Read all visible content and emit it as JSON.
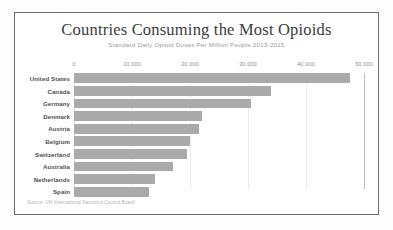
{
  "chart_data": {
    "type": "bar",
    "orientation": "horizontal",
    "title": "Countries Consuming the Most Opioids",
    "subtitle": "Standard Daily Opioid Doses Per Million People 2013-2015",
    "xlabel": "",
    "ylabel": "",
    "xlim": [
      0,
      50000
    ],
    "grid": true,
    "legend": false,
    "source": "Source: UN International Narcotics Control Board",
    "tick_labels": [
      "0",
      "10,000",
      "20,000",
      "30,000",
      "40,000",
      "50,000"
    ],
    "tick_values": [
      0,
      10000,
      20000,
      30000,
      40000,
      50000
    ],
    "categories": [
      "United States",
      "Canada",
      "Germany",
      "Denmark",
      "Austria",
      "Belgium",
      "Switzerland",
      "Australia",
      "Netherlands",
      "Spain"
    ],
    "values": [
      47500,
      34000,
      30500,
      22000,
      21500,
      20000,
      19500,
      17000,
      14000,
      13000
    ],
    "bar_color": "#aaaaaa"
  }
}
